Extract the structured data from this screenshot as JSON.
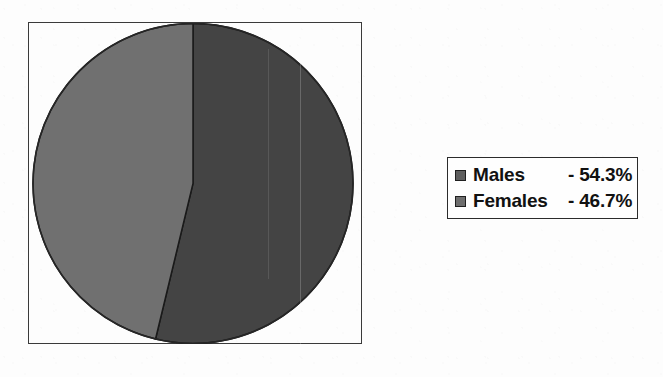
{
  "chart_data": {
    "type": "pie",
    "title": "",
    "categories": [
      "Males",
      "Females"
    ],
    "values": [
      54.3,
      46.7
    ],
    "value_labels": [
      "- 54.3%",
      "- 46.7%"
    ],
    "units": "%",
    "legend_position": "right",
    "grid": false,
    "start_angle_deg": 0,
    "direction": "clockwise",
    "colors": [
      "#444444",
      "#707070"
    ],
    "series": [
      {
        "name": "Gender distribution",
        "slices": [
          {
            "label": "Males",
            "value": 54.3,
            "value_label": "- 54.3%",
            "color": "#444444"
          },
          {
            "label": "Females",
            "value": 46.7,
            "value_label": "- 46.7%",
            "color": "#707070"
          }
        ]
      }
    ]
  },
  "figure": {
    "background_color": "#fdfdfd",
    "frame_color": "#3a3a3a",
    "slice_outline_color": "#1a1a1a"
  },
  "legend": {
    "border_color": "#2b2b2b",
    "background_color": "#fefefe",
    "entries": [
      {
        "label": "Males",
        "value": "- 54.3%",
        "swatch_color": "#5e5e5e"
      },
      {
        "label": "Females",
        "value": "- 46.7%",
        "swatch_color": "#6e6e6e"
      }
    ]
  }
}
